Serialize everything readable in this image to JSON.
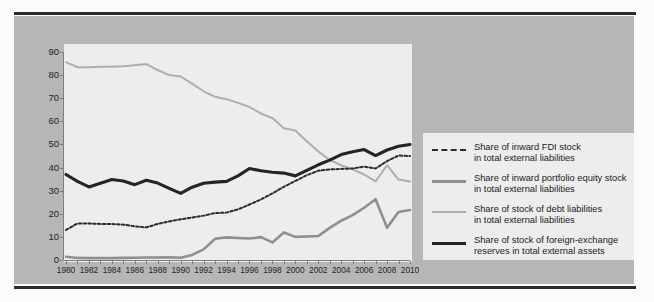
{
  "chart_data": {
    "type": "line",
    "title": "",
    "subtitle": "",
    "xlabel": "",
    "ylabel": "",
    "xlim": [
      1980,
      2010
    ],
    "ylim": [
      0,
      90
    ],
    "ytick_step": 10,
    "yticks": [
      0,
      10,
      20,
      30,
      40,
      50,
      60,
      70,
      80,
      90
    ],
    "xticks": [
      1980,
      1982,
      1984,
      1986,
      1988,
      1990,
      1992,
      1994,
      1996,
      1998,
      2000,
      2002,
      2004,
      2006,
      2008,
      2010
    ],
    "grid": false,
    "legend_position": "right",
    "x": [
      1980,
      1981,
      1982,
      1983,
      1984,
      1985,
      1986,
      1987,
      1988,
      1989,
      1990,
      1991,
      1992,
      1993,
      1994,
      1995,
      1996,
      1997,
      1998,
      1999,
      2000,
      2001,
      2002,
      2003,
      2004,
      2005,
      2006,
      2007,
      2008,
      2009,
      2010
    ],
    "series": [
      {
        "name": "Share of inward FDI stock in total external liabilities",
        "legend_line1": "Share of inward FDI stock",
        "legend_line2": "in total external liabilities",
        "style": "dotted",
        "color": "#2b2b2b",
        "width": 2.0,
        "values": [
          13.0,
          15.8,
          15.8,
          15.6,
          15.6,
          15.3,
          14.6,
          14.1,
          15.6,
          16.7,
          17.6,
          18.4,
          19.2,
          20.3,
          20.5,
          21.9,
          24.0,
          26.2,
          28.8,
          31.7,
          34.2,
          36.7,
          38.6,
          39.2,
          39.4,
          39.6,
          40.4,
          39.6,
          42.8,
          45.2,
          45.0
        ]
      },
      {
        "name": "Share of inward portfolio equity stock in total external liabilities",
        "legend_line1": "Share of inward portfolio equity stock",
        "legend_line2": "in total external liabilities",
        "style": "solid",
        "color": "#8f8f8f",
        "width": 2.6,
        "values": [
          1.4,
          0.9,
          0.8,
          0.8,
          0.8,
          0.9,
          1.0,
          1.1,
          1.1,
          1.2,
          1.0,
          2.2,
          4.6,
          9.2,
          9.8,
          9.5,
          9.3,
          9.9,
          7.6,
          11.9,
          10.0,
          10.2,
          10.4,
          13.9,
          17.0,
          19.4,
          22.6,
          26.3,
          14.0,
          20.8,
          21.6
        ]
      },
      {
        "name": "Share of stock of debt liabilities in total external liabilities",
        "legend_line1": "Share of stock of debt liabilities",
        "legend_line2": "in total external liabilities",
        "style": "solid",
        "color": "#aeaeae",
        "width": 2.0,
        "values": [
          85.6,
          83.4,
          83.4,
          83.6,
          83.6,
          83.8,
          84.3,
          84.8,
          82.2,
          80.0,
          79.4,
          76.3,
          73.0,
          70.6,
          69.6,
          68.0,
          66.2,
          63.4,
          61.4,
          57.0,
          56.0,
          51.4,
          47.0,
          43.3,
          41.0,
          39.2,
          37.0,
          34.0,
          41.0,
          34.8,
          34.0
        ]
      },
      {
        "name": "Share of stock of foreign-exchange reserves in total external assets",
        "legend_line1": "Share of stock of foreign-exchange",
        "legend_line2": "reserves in total external assets",
        "style": "solid",
        "color": "#242424",
        "width": 3.1,
        "values": [
          37.0,
          34.0,
          31.6,
          33.2,
          34.8,
          34.2,
          32.6,
          34.5,
          33.3,
          31.0,
          28.8,
          31.5,
          33.2,
          33.7,
          34.0,
          36.4,
          39.6,
          38.6,
          38.0,
          37.6,
          36.4,
          38.8,
          41.2,
          43.2,
          45.6,
          46.8,
          47.8,
          45.2,
          47.6,
          49.2,
          50.0
        ]
      }
    ]
  }
}
